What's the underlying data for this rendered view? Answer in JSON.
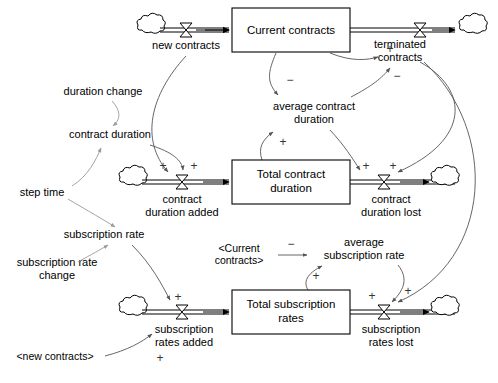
{
  "diagram": {
    "type": "system-dynamics-stock-flow",
    "colors": {
      "background": "#ffffff",
      "stroke": "#000000",
      "link": "#555555",
      "link_light": "#999999"
    }
  },
  "stocks": [
    {
      "id": "current_contracts",
      "label": "Current contracts",
      "x": 232,
      "y": 8,
      "w": 118,
      "h": 44
    },
    {
      "id": "total_contract_duration",
      "label_line1": "Total contract",
      "label_line2": "duration",
      "x": 232,
      "y": 160,
      "w": 118,
      "h": 44
    },
    {
      "id": "total_subscription_rates",
      "label_line1": "Total subscription",
      "label_line2": "rates",
      "x": 232,
      "y": 290,
      "w": 118,
      "h": 44
    }
  ],
  "flows": [
    {
      "id": "new_contracts",
      "label": "new contracts",
      "valve_x": 186,
      "valve_y": 30
    },
    {
      "id": "terminated_contracts",
      "label_line1": "terminated",
      "label_line2": "contracts",
      "valve_x": 420,
      "valve_y": 30
    },
    {
      "id": "contract_duration_added",
      "label_line1": "contract",
      "label_line2": "duration added",
      "valve_x": 182,
      "valve_y": 182
    },
    {
      "id": "contract_duration_lost",
      "label_line1": "contract",
      "label_line2": "duration lost",
      "valve_x": 384,
      "valve_y": 182
    },
    {
      "id": "subscription_rates_added",
      "label_line1": "subscription",
      "label_line2": "rates added",
      "valve_x": 182,
      "valve_y": 312
    },
    {
      "id": "subscription_rates_lost",
      "label_line1": "subscription",
      "label_line2": "rates lost",
      "valve_x": 384,
      "valve_y": 312
    }
  ],
  "auxiliaries": [
    {
      "id": "duration_change",
      "label": "duration change",
      "x": 103,
      "y": 92
    },
    {
      "id": "contract_duration",
      "label": "contract duration",
      "x": 110,
      "y": 134
    },
    {
      "id": "step_time",
      "label": "step time",
      "x": 42,
      "y": 192
    },
    {
      "id": "subscription_rate",
      "label": "subscription rate",
      "x": 104,
      "y": 234
    },
    {
      "id": "subscription_rate_change",
      "label_line1": "subscription rate",
      "label_line2": "change",
      "x": 57,
      "y": 262
    },
    {
      "id": "average_contract_duration",
      "label_line1": "average contract",
      "label_line2": "duration",
      "x": 314,
      "y": 107
    },
    {
      "id": "average_subscription_rate",
      "label_line1": "average",
      "label_line2": "subscription rate",
      "x": 364,
      "y": 242
    }
  ],
  "shadow_variables": [
    {
      "id": "shadow_current_contracts",
      "label_line1": "<Current",
      "label_line2": "contracts>",
      "x": 239,
      "y": 248
    },
    {
      "id": "shadow_new_contracts",
      "label": "<new contracts>",
      "x": 55,
      "y": 356
    }
  ],
  "links": [
    {
      "id": "new-contracts-to-contract-duration-added",
      "polarity": "+"
    },
    {
      "id": "current-contracts-to-average-contract-duration",
      "polarity": "−"
    },
    {
      "id": "current-contracts-to-terminated-contracts",
      "polarity": "+"
    },
    {
      "id": "average-contract-duration-to-terminated-contracts",
      "polarity": "−"
    },
    {
      "id": "total-contract-duration-to-average-contract-duration",
      "polarity": "+"
    },
    {
      "id": "duration-change-to-contract-duration",
      "polarity": ""
    },
    {
      "id": "step-time-to-contract-duration",
      "polarity": ""
    },
    {
      "id": "contract-duration-to-contract-duration-added",
      "polarity": "+"
    },
    {
      "id": "step-time-to-subscription-rate",
      "polarity": ""
    },
    {
      "id": "subscription-rate-change-to-subscription-rate",
      "polarity": ""
    },
    {
      "id": "subscription-rate-to-subscription-rates-added",
      "polarity": "+"
    },
    {
      "id": "shadow-current-contracts-to-average-subscription-rate",
      "polarity": "−"
    },
    {
      "id": "total-subscription-rates-to-average-subscription-rate",
      "polarity": "+"
    },
    {
      "id": "average-subscription-rate-to-subscription-rates-lost",
      "polarity": "+"
    },
    {
      "id": "terminated-contracts-to-contract-duration-lost",
      "polarity": "+"
    },
    {
      "id": "terminated-contracts-to-subscription-rates-lost",
      "polarity": "+"
    },
    {
      "id": "shadow-new-contracts-to-subscription-rates-added",
      "polarity": "+"
    }
  ],
  "polarity_marks": {
    "plus": "+",
    "minus": "−"
  }
}
